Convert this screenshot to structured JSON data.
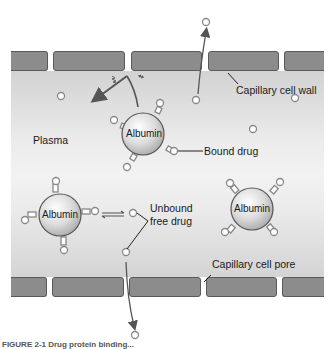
{
  "diagram": {
    "labels": {
      "plasma": "Plasma",
      "capillary_cell_wall": "Capillary cell wall",
      "bound_drug": "Bound drug",
      "unbound_free_drug_line1": "Unbound",
      "unbound_free_drug_line2": "free drug",
      "capillary_cell_pore": "Capillary cell pore"
    },
    "albumin": [
      {
        "label": "Albumin",
        "cx": 155,
        "cy": 134,
        "r": 21
      },
      {
        "label": "Albumin",
        "cx": 60,
        "cy": 216,
        "r": 21
      },
      {
        "label": "Albumin",
        "cx": 252,
        "cy": 210,
        "r": 21
      }
    ],
    "caption": "FIGURE 2-1 Drug protein binding..."
  },
  "colors": {
    "wall": "#8c8c8c",
    "wall_border": "#5a5a5a",
    "plasma": "#e8e8e8",
    "albumin": "#d9d9d9",
    "arrow": "#555555"
  }
}
